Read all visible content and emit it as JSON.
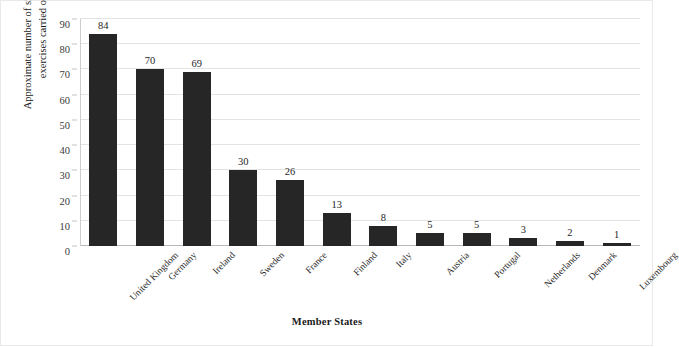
{
  "chart_data": {
    "type": "bar",
    "title": "",
    "xlabel": "Member States",
    "ylabel": "Approximate number of simulation\nexercises carried out",
    "categories": [
      "United Kingdom",
      "Germany",
      "Ireland",
      "Sweden",
      "France",
      "Finland",
      "Italy",
      "Austria",
      "Portugal",
      "Netherlands",
      "Denmark",
      "Luxembourg"
    ],
    "values": [
      84,
      70,
      69,
      30,
      26,
      13,
      8,
      5,
      5,
      3,
      2,
      1
    ],
    "ylim": [
      0,
      90
    ],
    "yticks": [
      0,
      10,
      20,
      30,
      40,
      50,
      60,
      70,
      80,
      90
    ],
    "ytick_labels": [
      "0",
      "10",
      "20",
      "30",
      "40",
      "50",
      "60",
      "70",
      "80",
      "90"
    ],
    "grid": true,
    "legend": "none",
    "bar_color": "#262626",
    "grid_color": "#e3e3e3",
    "axis_color": "#b9b9b9",
    "background": "#ffffff",
    "data_labels": [
      "84",
      "70",
      "69",
      "30",
      "26",
      "13",
      "8",
      "5",
      "5",
      "3",
      "2",
      "1"
    ]
  }
}
